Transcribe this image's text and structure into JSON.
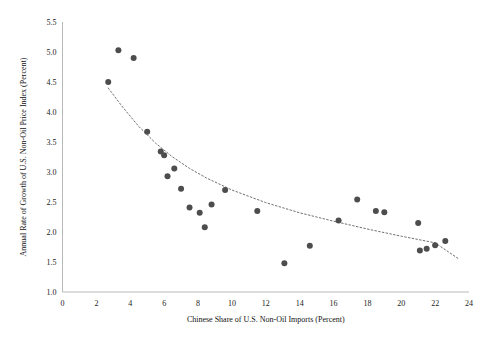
{
  "chart_data": {
    "type": "scatter",
    "title": "",
    "xlabel": "Chinese Share of U.S. Non-Oil Imports (Percent)",
    "ylabel": "Annual Rate of Growth of U.S. Non-Oil Price Index (Percent)",
    "xlim": [
      0,
      24
    ],
    "ylim": [
      1.0,
      5.5
    ],
    "xticks": [
      0,
      2,
      4,
      6,
      8,
      10,
      12,
      14,
      16,
      18,
      20,
      22,
      24
    ],
    "yticks": [
      1.0,
      1.5,
      2.0,
      2.5,
      3.0,
      3.5,
      4.0,
      4.5,
      5.0,
      5.5
    ],
    "xtick_labels": [
      "0",
      "2",
      "4",
      "6",
      "8",
      "10",
      "12",
      "14",
      "16",
      "18",
      "20",
      "22",
      "24"
    ],
    "ytick_labels": [
      "1.0",
      "1.5",
      "2.0",
      "2.5",
      "3.0",
      "3.5",
      "4.0",
      "4.5",
      "5.0",
      "5.5"
    ],
    "grid": false,
    "legend": "none",
    "marker_color": "#4d4d4d",
    "trendline_color": "#6f6f6f",
    "trendline_style": "dotted",
    "points": [
      {
        "x": 2.7,
        "y": 4.5
      },
      {
        "x": 3.3,
        "y": 5.03
      },
      {
        "x": 4.2,
        "y": 4.9
      },
      {
        "x": 5.0,
        "y": 3.67
      },
      {
        "x": 5.8,
        "y": 3.34
      },
      {
        "x": 6.0,
        "y": 3.28
      },
      {
        "x": 6.2,
        "y": 2.93
      },
      {
        "x": 6.6,
        "y": 3.06
      },
      {
        "x": 7.0,
        "y": 2.72
      },
      {
        "x": 7.5,
        "y": 2.41
      },
      {
        "x": 8.1,
        "y": 2.32
      },
      {
        "x": 8.4,
        "y": 2.08
      },
      {
        "x": 8.8,
        "y": 2.46
      },
      {
        "x": 9.6,
        "y": 2.7
      },
      {
        "x": 11.5,
        "y": 2.35
      },
      {
        "x": 13.1,
        "y": 1.48
      },
      {
        "x": 14.6,
        "y": 1.77
      },
      {
        "x": 16.3,
        "y": 2.19
      },
      {
        "x": 17.4,
        "y": 2.54
      },
      {
        "x": 18.5,
        "y": 2.35
      },
      {
        "x": 19.0,
        "y": 2.33
      },
      {
        "x": 21.0,
        "y": 2.15
      },
      {
        "x": 21.1,
        "y": 1.69
      },
      {
        "x": 21.5,
        "y": 1.72
      },
      {
        "x": 22.0,
        "y": 1.78
      },
      {
        "x": 22.6,
        "y": 1.85
      }
    ],
    "trendline": [
      {
        "x": 2.7,
        "y": 4.4
      },
      {
        "x": 3.5,
        "y": 4.1
      },
      {
        "x": 4.5,
        "y": 3.76
      },
      {
        "x": 5.5,
        "y": 3.48
      },
      {
        "x": 6.5,
        "y": 3.25
      },
      {
        "x": 7.5,
        "y": 3.06
      },
      {
        "x": 8.5,
        "y": 2.9
      },
      {
        "x": 10.0,
        "y": 2.7
      },
      {
        "x": 12.0,
        "y": 2.49
      },
      {
        "x": 14.0,
        "y": 2.32
      },
      {
        "x": 16.0,
        "y": 2.18
      },
      {
        "x": 18.0,
        "y": 2.05
      },
      {
        "x": 20.0,
        "y": 1.93
      },
      {
        "x": 22.0,
        "y": 1.82
      },
      {
        "x": 23.4,
        "y": 1.55
      }
    ]
  }
}
